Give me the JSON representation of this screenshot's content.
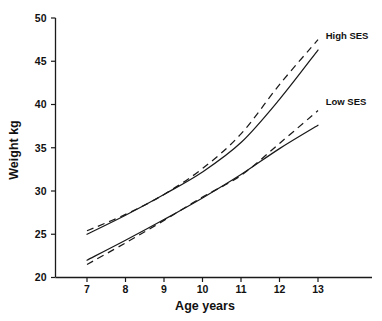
{
  "chart_data": {
    "type": "line",
    "title": "",
    "xlabel": "Age years",
    "ylabel": "Weight kg",
    "xlim": [
      6.5,
      13.6
    ],
    "ylim": [
      20,
      50
    ],
    "xticks": [
      7,
      8,
      9,
      10,
      11,
      12,
      13
    ],
    "yticks": [
      20,
      25,
      30,
      35,
      40,
      45,
      50
    ],
    "xtick_labels": [
      "7",
      "8",
      "9",
      "10",
      "11",
      "12",
      "13"
    ],
    "ytick_labels": [
      "20",
      "25",
      "30",
      "35",
      "40",
      "45",
      "50"
    ],
    "grid": false,
    "legend_position": "right-inline",
    "x": [
      7,
      8,
      9,
      10,
      11,
      12,
      13
    ],
    "series": [
      {
        "name": "High SES dashed",
        "group": "High SES",
        "style": "dashed",
        "values": [
          25.4,
          27.3,
          29.6,
          32.6,
          36.6,
          42.3,
          47.5
        ]
      },
      {
        "name": "High SES solid",
        "group": "High SES",
        "style": "solid",
        "values": [
          25.0,
          27.2,
          29.6,
          32.2,
          35.6,
          40.6,
          46.3
        ]
      },
      {
        "name": "Low SES dashed",
        "group": "Low SES",
        "style": "dashed",
        "values": [
          21.5,
          24.0,
          26.6,
          29.3,
          31.8,
          35.5,
          39.3
        ]
      },
      {
        "name": "Low SES solid",
        "group": "Low SES",
        "style": "solid",
        "values": [
          22.0,
          24.3,
          26.7,
          29.2,
          31.9,
          34.9,
          37.6
        ]
      }
    ],
    "annotations": [
      {
        "text": "High SES",
        "x": 13.2,
        "y": 48.0,
        "name": "high-ses-label"
      },
      {
        "text": "Low SES",
        "x": 13.2,
        "y": 40.4,
        "name": "low-ses-label"
      }
    ]
  }
}
